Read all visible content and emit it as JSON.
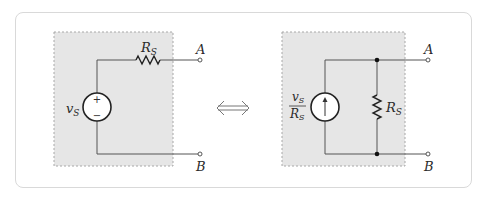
{
  "figure": {
    "left_circuit": {
      "name": "Thevenin equivalent",
      "source_label": "v",
      "source_label_sub": "S",
      "source_type": "voltage-source",
      "source_polarity": [
        "+",
        "−"
      ],
      "resistor_label": "R",
      "resistor_label_sub": "S",
      "terminal_top": "A",
      "terminal_bottom": "B"
    },
    "equivalence_symbol": "⟺",
    "right_circuit": {
      "name": "Norton equivalent",
      "source_label_num": "v",
      "source_label_num_sub": "S",
      "source_label_den": "R",
      "source_label_den_sub": "S",
      "source_type": "current-source",
      "resistor_label": "R",
      "resistor_label_sub": "S",
      "terminal_top": "A",
      "terminal_bottom": "B"
    },
    "colors": {
      "box_fill": "#e6e6e6",
      "box_border": "#a8a8a8",
      "wire": "#555555",
      "card_border": "#d9d9d9"
    }
  }
}
